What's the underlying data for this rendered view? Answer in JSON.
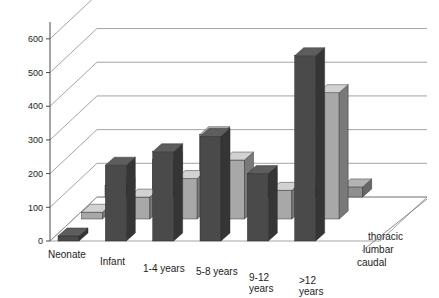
{
  "chart_data": {
    "type": "bar",
    "title": "",
    "subtitle": "",
    "xlabel": "",
    "ylabel": "",
    "zlabel": "",
    "projection": "3d-grouped-bars",
    "categories": [
      "Neonate",
      "Infant",
      "1-4 years",
      "5-8 years",
      "9-12 years",
      ">12 years"
    ],
    "series": [
      {
        "name": "thoracic",
        "color": "#8f8f8f",
        "values": [
          35,
          110,
          185,
          55,
          30,
          30
        ]
      },
      {
        "name": "lumbar",
        "color": "#a8a8a8",
        "values": [
          20,
          65,
          120,
          175,
          85,
          375
        ]
      },
      {
        "name": "caudal",
        "color": "#4a4a4a",
        "values": [
          15,
          225,
          265,
          310,
          200,
          550
        ]
      }
    ],
    "depth_order_front_to_back": [
      "caudal",
      "lumbar",
      "thoracic"
    ],
    "yticks": [
      0,
      100,
      200,
      300,
      400,
      500,
      600
    ],
    "ylim": [
      0,
      650
    ],
    "grid": true,
    "grid_axis": "y",
    "legend": "depth-axis-labels",
    "legend_position": "right"
  },
  "axis": {
    "y_tick_labels": [
      "600",
      "500",
      "400",
      "300",
      "200",
      "100",
      "0"
    ]
  },
  "category_labels": [
    "Neonate",
    "Infant",
    "1-4 years",
    "5-8 years",
    "9-12",
    "years",
    ">12",
    "years"
  ],
  "series_labels": [
    "thoracic",
    "lumbar",
    "caudal"
  ]
}
